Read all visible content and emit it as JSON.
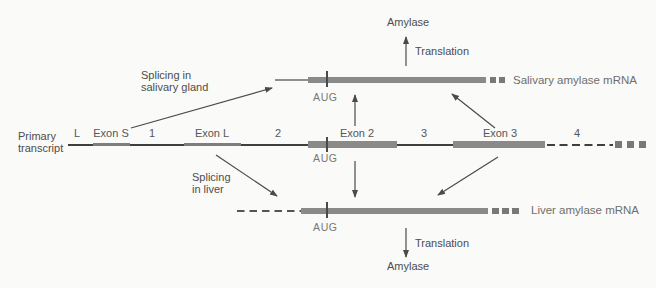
{
  "salivary": {
    "amylase_label": "Amylase",
    "translation_label": "Translation",
    "mrna_label": "Salivary amylase mRNA",
    "aug_label": "AUG",
    "splicing_line1": "Splicing in",
    "splicing_line2": "salivary gland"
  },
  "primary_transcript": {
    "name_line1": "Primary",
    "name_line2": "transcript",
    "aug_label": "AUG",
    "segments": [
      {
        "label": "L",
        "kind": "leader-exon"
      },
      {
        "label": "Exon S",
        "kind": "exon"
      },
      {
        "label": "1",
        "kind": "intron"
      },
      {
        "label": "Exon L",
        "kind": "exon"
      },
      {
        "label": "2",
        "kind": "intron"
      },
      {
        "label": "Exon 2",
        "kind": "coding-exon"
      },
      {
        "label": "3",
        "kind": "intron"
      },
      {
        "label": "Exon 3",
        "kind": "coding-exon"
      },
      {
        "label": "4",
        "kind": "intron-continues"
      }
    ]
  },
  "liver": {
    "amylase_label": "Amylase",
    "translation_label": "Translation",
    "mrna_label": "Liver amylase mRNA",
    "aug_label": "AUG",
    "splicing_line1": "Splicing",
    "splicing_line2": "in liver"
  },
  "colors": {
    "background": "#fafaf8",
    "exon_bar": "#8a8a8a",
    "exon_light": "#7e7e7e",
    "line": "#3f3f3f",
    "tick": "#4a4a4a",
    "square": "#787878",
    "arrow": "#4a4a4a",
    "text": "#4d4d4d",
    "text_muted": "#767676"
  }
}
